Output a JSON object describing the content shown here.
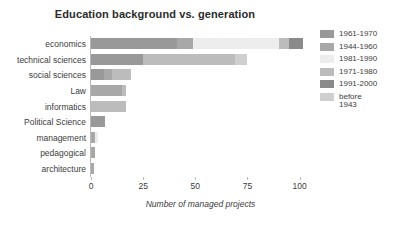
{
  "chart_data": {
    "type": "bar",
    "orientation": "horizontal",
    "stacked": true,
    "title": "Education background vs. generation",
    "xlabel": "Number of managed projects",
    "ylabel": "",
    "xlim": [
      0,
      105
    ],
    "xticks": [
      0,
      25,
      50,
      75,
      100
    ],
    "xtick_labels": [
      "0",
      "25",
      "50",
      "75",
      "100"
    ],
    "grid": false,
    "legend_position": "right",
    "categories": [
      "economics",
      "technical sciences",
      "social sciences",
      "Law",
      "informatics",
      "Political Science",
      "management",
      "pedagogical",
      "architecture"
    ],
    "series": [
      {
        "name": "1961-1970",
        "color": "#999999",
        "values": [
          41,
          25,
          6,
          0,
          0,
          6.5,
          0,
          0,
          0
        ]
      },
      {
        "name": "1944-1960",
        "color": "#a8a8a8",
        "values": [
          8,
          0,
          4,
          15,
          0,
          0,
          2,
          2,
          1.5
        ]
      },
      {
        "name": "1981-1990",
        "color": "#ededed",
        "values": [
          41,
          0,
          0,
          0,
          0,
          0,
          1.5,
          0,
          0
        ]
      },
      {
        "name": "1971-1980",
        "color": "#bcbcbc",
        "values": [
          5,
          44,
          9,
          2,
          17,
          0,
          0,
          0,
          0
        ]
      },
      {
        "name": "1991-2000",
        "color": "#8a8a8a",
        "values": [
          6.5,
          0,
          0,
          0,
          0,
          0,
          0,
          0,
          0
        ]
      },
      {
        "name": "before\n1943",
        "color": "#cfcfcf",
        "values": [
          0,
          6,
          0,
          0,
          0,
          0,
          0,
          0,
          0
        ]
      }
    ],
    "totals": [
      101.5,
      75,
      19,
      17,
      17,
      6.5,
      3.5,
      2,
      1.5
    ]
  },
  "legend": {
    "items": [
      {
        "label": "1961-1970",
        "color": "#999999"
      },
      {
        "label": "1944-1960",
        "color": "#a8a8a8"
      },
      {
        "label": "1981-1990",
        "color": "#ededed"
      },
      {
        "label": "1971-1980",
        "color": "#bcbcbc"
      },
      {
        "label": "1991-2000",
        "color": "#8a8a8a"
      },
      {
        "label": "before\n1943",
        "color": "#cfcfcf"
      }
    ]
  }
}
